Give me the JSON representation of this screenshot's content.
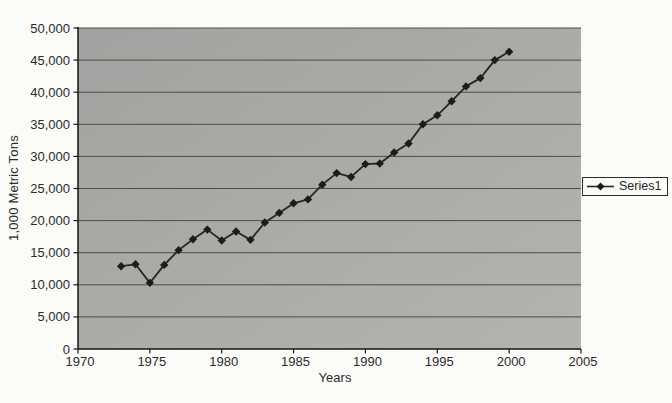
{
  "chart_data": {
    "type": "line",
    "title": "",
    "xlabel": "Years",
    "ylabel": "1,000 Metric Tons",
    "xlim": [
      1970,
      2005
    ],
    "ylim": [
      0,
      50000
    ],
    "xticks": [
      1970,
      1975,
      1980,
      1985,
      1990,
      1995,
      2000,
      2005
    ],
    "yticks": [
      0,
      5000,
      10000,
      15000,
      20000,
      25000,
      30000,
      35000,
      40000,
      45000,
      50000
    ],
    "ytick_labels": [
      "0",
      "5,000",
      "10,000",
      "15,000",
      "20,000",
      "25,000",
      "30,000",
      "35,000",
      "40,000",
      "45,000",
      "50,000"
    ],
    "grid": "horizontal",
    "legend": {
      "position": "right",
      "entries": [
        "Series1"
      ]
    },
    "x": [
      1973,
      1974,
      1975,
      1976,
      1977,
      1978,
      1979,
      1980,
      1981,
      1982,
      1983,
      1984,
      1985,
      1986,
      1987,
      1988,
      1989,
      1990,
      1991,
      1992,
      1993,
      1994,
      1995,
      1996,
      1997,
      1998,
      1999,
      2000
    ],
    "series": [
      {
        "name": "Series1",
        "marker": "diamond",
        "color": "#262626",
        "values": [
          12900,
          13200,
          10300,
          13100,
          15400,
          17100,
          18600,
          16900,
          18300,
          17000,
          19700,
          21200,
          22700,
          23300,
          25600,
          27400,
          26800,
          28800,
          28900,
          30600,
          32000,
          35000,
          36400,
          38600,
          40900,
          42200,
          45000,
          46300
        ]
      }
    ],
    "colors": {
      "plot_bg_top": "#a2a2a0",
      "plot_bg_bottom": "#b3b3af",
      "gridline": "#4c4c49",
      "axis": "#161616",
      "marker_fill": "#1c1c1c",
      "text": "#2b2b2b",
      "page_bg": "#fbfbf8"
    }
  }
}
